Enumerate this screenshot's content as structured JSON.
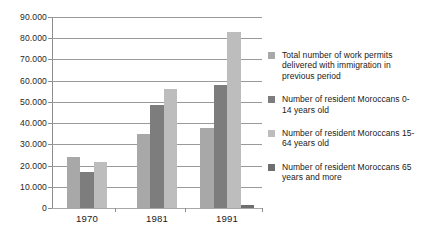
{
  "chart_data": {
    "type": "bar",
    "title": "",
    "subtitle": "",
    "xlabel": "",
    "ylabel": "",
    "categories": [
      "1970",
      "1981",
      "1991"
    ],
    "ylim": [
      0,
      90000
    ],
    "ytick_values": [
      0,
      10000,
      20000,
      30000,
      40000,
      50000,
      60000,
      70000,
      80000,
      90000
    ],
    "ytick_labels": [
      "0",
      "10.000",
      "20.000",
      "30.000",
      "40.000",
      "50.000",
      "60.000",
      "70.000",
      "80.000",
      "90.000"
    ],
    "grid": true,
    "legend_position": "right",
    "series": [
      {
        "name": "Total number of work permits delivered with immigration in previous period",
        "color": "#a8a8a8",
        "values": [
          24000,
          35000,
          37500
        ]
      },
      {
        "name": "Number of resident Moroccans 0-14 years old",
        "color": "#7d7d7d",
        "values": [
          17000,
          48500,
          58000
        ]
      },
      {
        "name": "Number of resident Moroccans 15-64 years old",
        "color": "#bdbdbd",
        "values": [
          21500,
          56000,
          83000
        ]
      },
      {
        "name": "Number of resident Moroccans 65 years and more",
        "color": "#6e6e6e",
        "values": [
          0,
          0,
          1500
        ]
      }
    ]
  },
  "legend": {
    "entries": [
      {
        "label": "Total number of work permits delivered with immigration in previous period",
        "color": "#a8a8a8"
      },
      {
        "label": "Number of resident Moroccans 0-14 years old",
        "color": "#7d7d7d"
      },
      {
        "label": "Number of resident Moroccans 15-64 years old",
        "color": "#bdbdbd"
      },
      {
        "label": "Number of resident Moroccans 65 years and more",
        "color": "#6e6e6e"
      }
    ]
  }
}
